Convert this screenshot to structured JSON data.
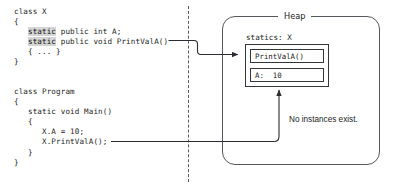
{
  "figure": {
    "left_panel": {
      "class_x": {
        "lines": [
          {
            "segments": [
              {
                "text": "class X",
                "highlight": false
              }
            ]
          },
          {
            "segments": [
              {
                "text": "{",
                "highlight": false
              }
            ]
          },
          {
            "segments": [
              {
                "text": "   ",
                "highlight": false
              },
              {
                "text": "static",
                "highlight": true
              },
              {
                "text": " public int A;",
                "highlight": false
              }
            ]
          },
          {
            "segments": [
              {
                "text": "   ",
                "highlight": false
              },
              {
                "text": "static",
                "highlight": true
              },
              {
                "text": " public void PrintValA()",
                "highlight": false
              }
            ]
          },
          {
            "segments": [
              {
                "text": "   { ... }",
                "highlight": false
              }
            ]
          },
          {
            "segments": [
              {
                "text": "}",
                "highlight": false
              }
            ]
          }
        ]
      },
      "class_program": {
        "lines": [
          {
            "segments": [
              {
                "text": "class Program",
                "highlight": false
              }
            ]
          },
          {
            "segments": [
              {
                "text": "{",
                "highlight": false
              }
            ]
          },
          {
            "segments": [
              {
                "text": "   static void Main()",
                "highlight": false
              }
            ]
          },
          {
            "segments": [
              {
                "text": "   {",
                "highlight": false
              }
            ]
          },
          {
            "segments": [
              {
                "text": "      X.A = 10;",
                "highlight": false
              }
            ]
          },
          {
            "segments": [
              {
                "text": "      X.PrintValA();",
                "highlight": false
              }
            ]
          },
          {
            "segments": [
              {
                "text": "   }",
                "highlight": false
              }
            ]
          },
          {
            "segments": [
              {
                "text": "}",
                "highlight": false
              }
            ]
          }
        ]
      }
    },
    "right_panel": {
      "heap_label": "Heap",
      "statics_label": "statics: X",
      "members": [
        {
          "text": "PrintValA()"
        },
        {
          "text": "A:  10"
        }
      ],
      "note": "No instances exist."
    },
    "colors": {
      "keyword_highlight": "#d5d5d5",
      "box_stroke": "#33363a",
      "panel_stroke": "#55585c",
      "divider_stroke": "#5a5a5a",
      "text": "#1c1c1c",
      "background": "#ffffff"
    }
  }
}
